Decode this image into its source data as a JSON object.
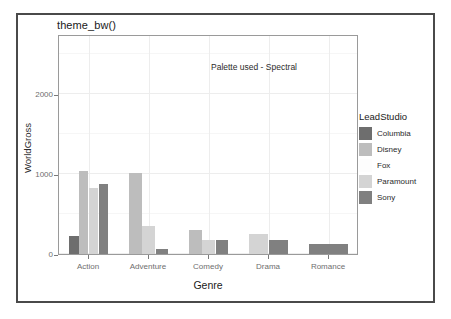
{
  "figure": {
    "title": "theme_bw()",
    "annotation": "Palette used - Spectral"
  },
  "chart_data": {
    "type": "bar",
    "title": "theme_bw()",
    "xlabel": "Genre",
    "ylabel": "WorldGross",
    "categories": [
      "Action",
      "Adventure",
      "Comedy",
      "Drama",
      "Romance"
    ],
    "ylim": [
      0,
      2750
    ],
    "yticks": [
      0,
      1000,
      2000
    ],
    "ytick_labels": [
      "0",
      "1000",
      "2000"
    ],
    "grid": true,
    "legend_position": "right",
    "legend_title": "LeadStudio",
    "annotation": "Palette used - Spectral",
    "palette": "Spectral",
    "series": [
      {
        "name": "Columbia",
        "color": "#6e6e6e",
        "values": [
          230,
          0,
          0,
          0,
          0
        ]
      },
      {
        "name": "Disney",
        "color": "#bdbdbd",
        "values": [
          1040,
          1010,
          295,
          0,
          0
        ]
      },
      {
        "name": "Fox",
        "color": "#fdfdfd",
        "values": [
          0,
          0,
          0,
          0,
          0
        ]
      },
      {
        "name": "Paramount",
        "color": "#d4d4d4",
        "values": [
          820,
          355,
          170,
          255,
          0
        ]
      },
      {
        "name": "Sony",
        "color": "#808080",
        "values": [
          880,
          65,
          180,
          175,
          120
        ]
      }
    ]
  },
  "legend": {
    "title": "LeadStudio",
    "items": [
      {
        "label": "Columbia",
        "color": "#6e6e6e"
      },
      {
        "label": "Disney",
        "color": "#bdbdbd"
      },
      {
        "label": "Fox",
        "color": "#fdfdfd"
      },
      {
        "label": "Paramount",
        "color": "#d4d4d4"
      },
      {
        "label": "Sony",
        "color": "#808080"
      }
    ]
  }
}
